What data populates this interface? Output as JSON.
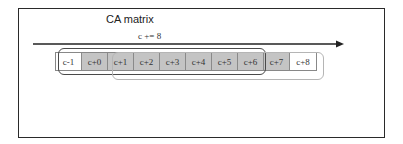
{
  "diagram": {
    "title": "CA matrix",
    "step_label": "c += 8",
    "arrow": {
      "direction": "right",
      "color": "#222222"
    },
    "cells": [
      {
        "label": "c-1",
        "shaded": false
      },
      {
        "label": "c+0",
        "shaded": true
      },
      {
        "label": "c+1",
        "shaded": true
      },
      {
        "label": "c+2",
        "shaded": true
      },
      {
        "label": "c+3",
        "shaded": true
      },
      {
        "label": "c+4",
        "shaded": true
      },
      {
        "label": "c+5",
        "shaded": true
      },
      {
        "label": "c+6",
        "shaded": true
      },
      {
        "label": "c+7",
        "shaded": true
      },
      {
        "label": "c+8",
        "shaded": false
      }
    ],
    "windows": [
      {
        "name": "current-window",
        "from": "c-1",
        "to": "c+6",
        "color": "#4a4a4a"
      },
      {
        "name": "next-window",
        "from": "c+1",
        "to": "c+8",
        "color": "#b5b5b5"
      }
    ],
    "colors": {
      "shaded": "#c4c4c4",
      "border": "#2a2a2a"
    }
  }
}
